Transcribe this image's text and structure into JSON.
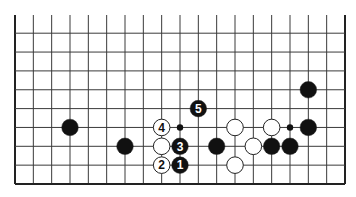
{
  "diagram": {
    "type": "go-board-partial",
    "board_size": 19,
    "visible_rows": 9,
    "edges": {
      "left": true,
      "right": true,
      "bottom": true,
      "top": false
    },
    "colors": {
      "background": "#ffffff",
      "line": "#3a3a3a",
      "edge": "#222222",
      "black_stone": "#111111",
      "white_stone": "#ffffff",
      "stone_outline": "#222222"
    },
    "star_points": [
      {
        "col": 10,
        "row": 4
      },
      {
        "col": 16,
        "row": 4
      }
    ],
    "stones": [
      {
        "color": "black",
        "col": 4,
        "row": 4,
        "label": ""
      },
      {
        "color": "black",
        "col": 7,
        "row": 3,
        "label": ""
      },
      {
        "color": "white",
        "col": 9,
        "row": 4,
        "label": "4"
      },
      {
        "color": "white",
        "col": 9,
        "row": 3,
        "label": ""
      },
      {
        "color": "white",
        "col": 9,
        "row": 2,
        "label": "2"
      },
      {
        "color": "black",
        "col": 10,
        "row": 3,
        "label": "3"
      },
      {
        "color": "black",
        "col": 10,
        "row": 2,
        "label": "1"
      },
      {
        "color": "black",
        "col": 11,
        "row": 5,
        "label": "5"
      },
      {
        "color": "black",
        "col": 12,
        "row": 3,
        "label": ""
      },
      {
        "color": "white",
        "col": 13,
        "row": 4,
        "label": ""
      },
      {
        "color": "white",
        "col": 13,
        "row": 2,
        "label": ""
      },
      {
        "color": "white",
        "col": 14,
        "row": 3,
        "label": ""
      },
      {
        "color": "white",
        "col": 15,
        "row": 4,
        "label": ""
      },
      {
        "color": "black",
        "col": 15,
        "row": 3,
        "label": ""
      },
      {
        "color": "black",
        "col": 16,
        "row": 3,
        "label": ""
      },
      {
        "color": "black",
        "col": 17,
        "row": 4,
        "label": ""
      },
      {
        "color": "black",
        "col": 17,
        "row": 6,
        "label": ""
      }
    ]
  }
}
